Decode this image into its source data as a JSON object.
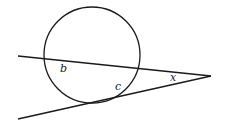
{
  "figure": {
    "type": "circle with secant and tangent from external point",
    "stroke_color": "#1a1a1a",
    "circle": {
      "cx": 92,
      "cy": 55,
      "r": 48
    },
    "secant_line": {
      "x1": 18,
      "y1": 56,
      "x2": 211,
      "y2": 76
    },
    "tangent_line": {
      "x1": 18,
      "y1": 119,
      "x2": 211,
      "y2": 76
    },
    "labels": {
      "b": "b",
      "c": "c",
      "x": "x"
    }
  }
}
